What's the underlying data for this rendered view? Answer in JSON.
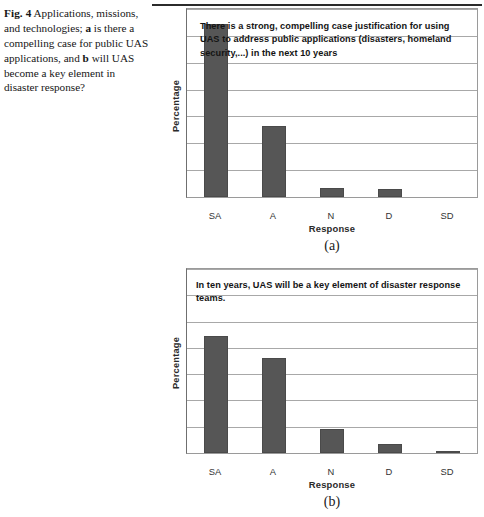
{
  "caption": {
    "label": "Fig. 4",
    "text_1": "Applications, missions, and technologies; ",
    "bold_a": "a",
    "text_2": " is there a compelling case for public UAS applications, and ",
    "bold_b": "b",
    "text_3": " will UAS become a key element in disaster response?"
  },
  "chart_data": [
    {
      "id": "a",
      "type": "bar",
      "title": "There is a strong, compelling case justification for using UAS to address public applications (disasters, homeland security,...) in the next 10 years",
      "panel_letter": "(a)",
      "categories": [
        "SA",
        "A",
        "N",
        "D",
        "SD"
      ],
      "values": [
        64.5,
        26.5,
        3.2,
        2.9,
        0
      ],
      "xlabel": "Response",
      "ylabel": "Percentage",
      "ylim": [
        0,
        70
      ],
      "yticks": [
        0,
        10,
        20,
        30,
        40,
        50,
        60,
        70
      ],
      "grid": true,
      "legend": "none",
      "bar_color": "#565656"
    },
    {
      "id": "b",
      "type": "bar",
      "title": "In ten years, UAS will be a key element of disaster response teams.",
      "panel_letter": "(b)",
      "categories": [
        "SA",
        "A",
        "N",
        "D",
        "SD"
      ],
      "values": [
        44.5,
        36.0,
        9.0,
        3.5,
        0.7
      ],
      "xlabel": "Response",
      "ylabel": "Percentage",
      "ylim": [
        0,
        70
      ],
      "yticks": [
        0,
        10,
        20,
        30,
        40,
        50,
        60,
        70
      ],
      "grid": true,
      "legend": "none",
      "bar_color": "#565656"
    }
  ]
}
